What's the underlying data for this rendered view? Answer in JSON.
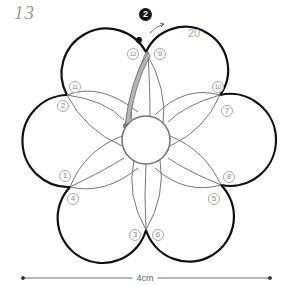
{
  "diagram": {
    "step_number": "13",
    "wind_count": "20",
    "step_badge": "2",
    "scale_label": "4cm",
    "pins": [
      {
        "label": "1",
        "x": 59,
        "y": 170
      },
      {
        "label": "2",
        "x": 57,
        "y": 100
      },
      {
        "label": "3",
        "x": 129,
        "y": 229
      },
      {
        "label": "4",
        "x": 67,
        "y": 193
      },
      {
        "label": "5",
        "x": 208,
        "y": 193
      },
      {
        "label": "6",
        "x": 152,
        "y": 229
      },
      {
        "label": "7",
        "x": 221,
        "y": 105
      },
      {
        "label": "8",
        "x": 223,
        "y": 171
      },
      {
        "label": "9",
        "x": 154,
        "y": 48
      },
      {
        "label": "10",
        "x": 212,
        "y": 81
      },
      {
        "label": "11",
        "x": 69,
        "y": 81
      },
      {
        "label": "12",
        "x": 127,
        "y": 48
      }
    ],
    "colors": {
      "outline": "#111111",
      "thread": "#666666",
      "highlight_fill": "#b5b5b5",
      "label": "#999999"
    }
  }
}
